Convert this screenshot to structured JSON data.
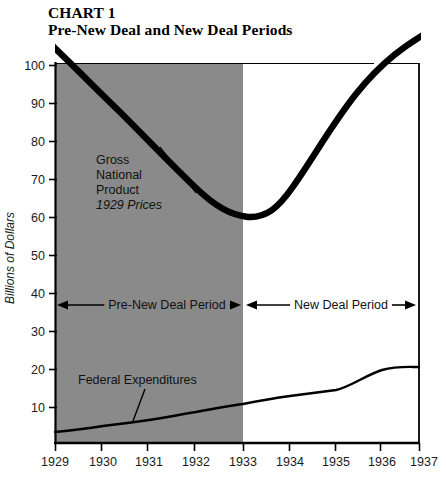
{
  "chart_data": {
    "type": "line",
    "title": "CHART 1",
    "subtitle": "Pre-New Deal and New Deal Periods",
    "xlabel": "",
    "ylabel": "Billions of Dollars",
    "xlim": [
      1929,
      1937
    ],
    "ylim": [
      0,
      100
    ],
    "grid": false,
    "legend": "none",
    "x": [
      1929,
      1930,
      1931,
      1932,
      1933,
      1934,
      1935,
      1936,
      1937
    ],
    "xticklabels": [
      "1929",
      "1930",
      "1931",
      "1932",
      "1933",
      "1934",
      "1935",
      "1936",
      "1937"
    ],
    "yticks": [
      10,
      20,
      30,
      40,
      50,
      60,
      70,
      80,
      90,
      100
    ],
    "yticklabels": [
      "10",
      "20",
      "30",
      "40",
      "50",
      "60",
      "70",
      "80",
      "90",
      "100"
    ],
    "series": [
      {
        "name": "Gross National Product",
        "units": "1929 Prices",
        "values": [
          104,
          95,
          86,
          77,
          73,
          80,
          89,
          99,
          106
        ]
      },
      {
        "name": "Federal Expenditures",
        "values": [
          3,
          3.3,
          4,
          4.6,
          5,
          6.4,
          7,
          9.5,
          10
        ]
      }
    ],
    "annotations": [
      {
        "name": "gnp-label",
        "text_lines": [
          "Gross",
          "National",
          "Product"
        ],
        "italic_line": "1929 Prices"
      },
      {
        "name": "federal-expenditures-label",
        "text": "Federal Expenditures"
      },
      {
        "name": "pre-new-deal-period",
        "text": "Pre-New Deal Period",
        "span": [
          1929,
          1933
        ]
      },
      {
        "name": "new-deal-period",
        "text": "New Deal Period",
        "span": [
          1933,
          1937
        ]
      }
    ],
    "shaded_region": {
      "from": 1929,
      "to": 1933,
      "color": "#8a8a8a",
      "label": "Pre-New Deal Period"
    }
  },
  "colors": {
    "shade": "#8a8a8a",
    "line": "#000000",
    "axis": "#000000",
    "background": "#ffffff",
    "text": "#111111"
  }
}
